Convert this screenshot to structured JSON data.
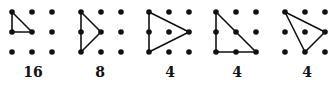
{
  "figure": {
    "ink_color": "#111111",
    "background": "#ffffff",
    "dot_radius": 2.8,
    "line_width": 1.6,
    "grids": [
      {
        "origin_x": 12,
        "label": "16",
        "label_x": 33,
        "triangle": [
          [
            0,
            0
          ],
          [
            0,
            1
          ],
          [
            1,
            1
          ]
        ]
      },
      {
        "origin_x": 81,
        "label": "8",
        "label_x": 100,
        "triangle": [
          [
            0,
            0
          ],
          [
            0,
            2
          ],
          [
            1,
            1
          ]
        ]
      },
      {
        "origin_x": 149,
        "label": "4",
        "label_x": 170,
        "triangle": [
          [
            0,
            0
          ],
          [
            0,
            2
          ],
          [
            2,
            1
          ]
        ]
      },
      {
        "origin_x": 216,
        "label": "4",
        "label_x": 237,
        "triangle": [
          [
            0,
            0
          ],
          [
            0,
            2
          ],
          [
            2,
            2
          ]
        ]
      },
      {
        "origin_x": 285,
        "label": "4",
        "label_x": 307,
        "triangle": [
          [
            0,
            0
          ],
          [
            2,
            1
          ],
          [
            1,
            2
          ]
        ]
      }
    ],
    "grid_origin_y": 12,
    "spacing": 20
  }
}
